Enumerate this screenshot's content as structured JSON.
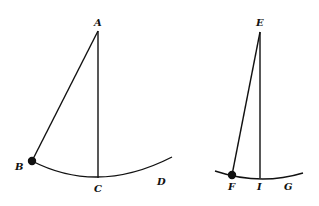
{
  "figure": {
    "left_pendulum": {
      "pivot_label": "A",
      "bob_label": "B",
      "lowest_point_label": "C",
      "arc_end_label": "D"
    },
    "right_pendulum": {
      "pivot_label": "E",
      "bob_label": "F",
      "lowest_point_label": "I",
      "arc_end_label": "G"
    },
    "colors": {
      "ink": "#111111",
      "background": "#ffffff"
    }
  }
}
